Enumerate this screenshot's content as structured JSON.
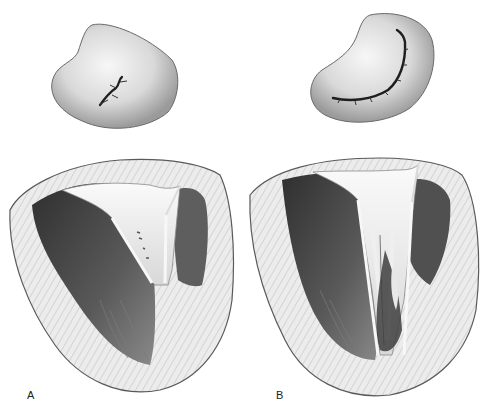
{
  "figure": {
    "panels": [
      {
        "label": "A",
        "valve_view": "mitral valve, normal closed (central small coaptation)",
        "section_view": "left ventricle longitudinal section with mitral leaflets"
      },
      {
        "label": "B",
        "valve_view": "mitral valve with long curved coaptation line",
        "section_view": "left ventricle longitudinal section with elongated leaflets and chordae"
      }
    ],
    "colors": {
      "background": "#ffffff",
      "myocardium": "#e6e6e6",
      "cavity_dark": "#4a4a4a",
      "leaflet": "#f2f2f2",
      "outline": "#555555"
    }
  }
}
